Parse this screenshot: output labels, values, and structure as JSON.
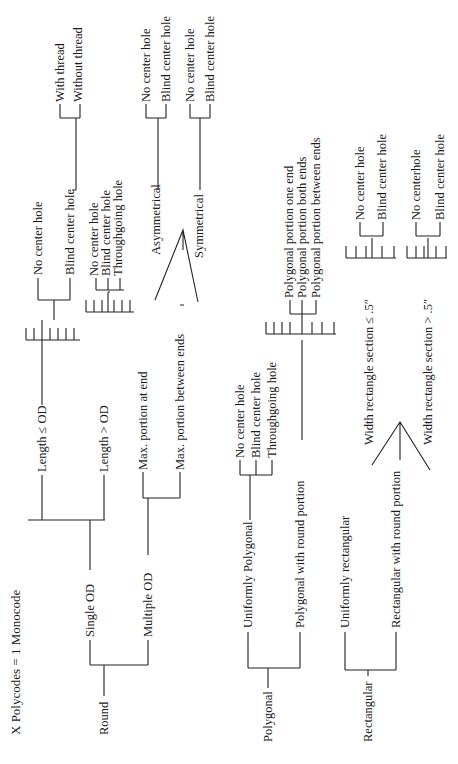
{
  "title": "X Polycodes = 1 Monocode",
  "tree": {
    "round": {
      "label": "Round",
      "single_od": {
        "label": "Single OD",
        "length_le_od": {
          "label": "Length ≤ OD",
          "children": [
            "No center hole",
            "Blind center hole"
          ],
          "blind_children": [
            "With thread",
            "Without thread"
          ]
        },
        "length_gt_od": {
          "label": "Length > OD",
          "children": [
            "No center hole",
            "Blind center hole",
            "Throughgoing hole"
          ]
        }
      },
      "multiple_od": {
        "label": "Multiple OD",
        "max_end": {
          "label": "Max. portion at end",
          "children": [
            "Asymmetrical",
            "Symmetrical"
          ]
        },
        "max_between": {
          "label": "Max. portion between ends",
          "asymmetrical": {
            "label": "Asymmetrical",
            "children": [
              "No center hole",
              "Blind center hole"
            ]
          },
          "symmetrical": {
            "label": "Symmetrical",
            "children": [
              "No center hole",
              "Blind center hole"
            ]
          }
        }
      }
    },
    "polygonal": {
      "label": "Polygonal",
      "uniform": {
        "label": "Uniformly Polygonal",
        "children": [
          "No center hole",
          "Blind center hole",
          "Throughgoing hole"
        ]
      },
      "with_round": {
        "label": "Polygonal with round portion",
        "children": [
          "Polygonal portion one end",
          "Polygonal portion both ends",
          "Polygonal portion between ends"
        ]
      }
    },
    "rectangular": {
      "label": "Rectangular",
      "uniform": {
        "label": "Uniformly rectangular"
      },
      "with_round": {
        "label": "Rectangular with round portion",
        "le": {
          "label": "Width rectangle section ≤ .5″",
          "children": [
            "No center hole",
            "Blind center hole"
          ]
        },
        "gt": {
          "label": "Width rectangle section > .5″",
          "children": [
            "No centerhole",
            "Blind center hole"
          ]
        }
      }
    }
  }
}
